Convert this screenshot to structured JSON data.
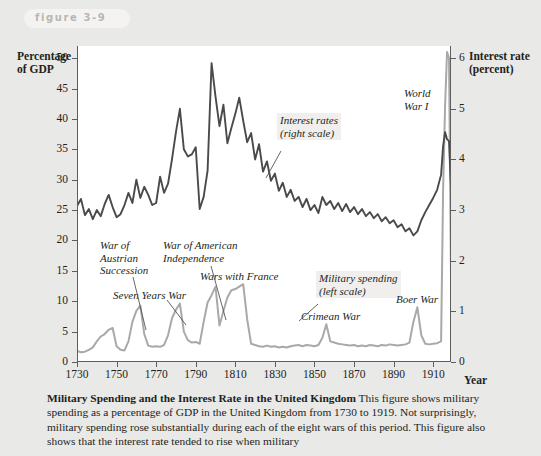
{
  "figure": {
    "badge_label": "figure 3-9"
  },
  "axes": {
    "y_left_title": "Percentage\nof GDP",
    "y_right_title": "Interest rate\n(percent)",
    "x_title": "Year"
  },
  "caption": {
    "bold_lead": "Military Spending and the Interest Rate in the United Kingdom",
    "body": " This figure shows military spending as a percentage of GDP in the United Kingdom from 1730 to 1919. Not surprisingly, military spending rose substantially during each of the eight wars of this period. This figure also shows that the interest rate tended to rise when military"
  },
  "annotations": [
    {
      "name": "war-of-austrian-succession",
      "text": "War of\nAustrian\nSuccession",
      "x": 100,
      "y": 239,
      "boxed": false
    },
    {
      "name": "seven-years-war",
      "text": "Seven Years War",
      "x": 113,
      "y": 289,
      "boxed": false
    },
    {
      "name": "war-of-american-independence",
      "text": "War of American\nIndependence",
      "x": 163,
      "y": 239,
      "boxed": false
    },
    {
      "name": "wars-with-france",
      "text": "Wars with France",
      "x": 200,
      "y": 270,
      "boxed": false
    },
    {
      "name": "interest-rates-right-scale",
      "text": "Interest rates\n(right scale)",
      "x": 277,
      "y": 113,
      "boxed": true
    },
    {
      "name": "world-war-one",
      "text": "World\nWar I",
      "x": 404,
      "y": 87,
      "boxed": false
    },
    {
      "name": "military-spending-left-scale",
      "text": "Military spending\n(left scale)",
      "x": 316,
      "y": 271,
      "boxed": true
    },
    {
      "name": "crimean-war",
      "text": "Crimean War",
      "x": 301,
      "y": 310,
      "boxed": false
    },
    {
      "name": "boer-war",
      "text": "Boer War",
      "x": 396,
      "y": 293,
      "boxed": false
    }
  ],
  "colors": {
    "interest_rate_line": "#4a4a4a",
    "military_spending_line": "#a9a9a9",
    "axis": "#5e5e5e",
    "page_background": "#e9e9e7",
    "plot_background": "#ffffff"
  },
  "chart_data": {
    "type": "line",
    "title": "Military Spending and the Interest Rate in the United Kingdom",
    "xlabel": "Year",
    "ylabel": "Percentage of GDP",
    "y2label": "Interest rate (percent)",
    "xlim": [
      1730,
      1919
    ],
    "ylim": [
      0,
      52
    ],
    "y2lim": [
      0,
      6.24
    ],
    "grid": false,
    "legend": "in-plot annotations",
    "x_ticks": [
      1730,
      1750,
      1770,
      1790,
      1810,
      1830,
      1850,
      1870,
      1890,
      1910
    ],
    "y_left_ticks": [
      0,
      5,
      10,
      15,
      20,
      25,
      30,
      35,
      40,
      45,
      50
    ],
    "y_right_ticks": [
      0,
      1,
      2,
      3,
      4,
      5,
      6
    ],
    "series": [
      {
        "name": "Interest rates (right scale)",
        "axis": "right",
        "color": "#4a4a4a",
        "x": [
          1730,
          1732,
          1734,
          1736,
          1738,
          1740,
          1742,
          1744,
          1746,
          1748,
          1750,
          1752,
          1754,
          1756,
          1758,
          1760,
          1762,
          1764,
          1766,
          1768,
          1770,
          1772,
          1774,
          1776,
          1778,
          1780,
          1782,
          1784,
          1786,
          1788,
          1790,
          1792,
          1794,
          1796,
          1798,
          1800,
          1802,
          1804,
          1806,
          1808,
          1810,
          1812,
          1814,
          1816,
          1818,
          1820,
          1822,
          1824,
          1826,
          1828,
          1830,
          1832,
          1834,
          1836,
          1838,
          1840,
          1842,
          1844,
          1846,
          1848,
          1850,
          1852,
          1854,
          1856,
          1858,
          1860,
          1862,
          1864,
          1866,
          1868,
          1870,
          1872,
          1874,
          1876,
          1878,
          1880,
          1882,
          1884,
          1886,
          1888,
          1890,
          1892,
          1894,
          1896,
          1898,
          1900,
          1902,
          1904,
          1906,
          1908,
          1910,
          1912,
          1914,
          1915,
          1916,
          1917,
          1918,
          1919
        ],
        "values_right_scale": [
          3.08,
          3.22,
          2.9,
          3.02,
          2.82,
          3.0,
          2.88,
          3.12,
          3.3,
          3.06,
          2.86,
          2.92,
          3.1,
          3.34,
          3.14,
          3.6,
          3.24,
          3.46,
          3.3,
          3.1,
          3.14,
          3.66,
          3.34,
          3.52,
          4.0,
          4.54,
          5.0,
          4.2,
          4.06,
          4.1,
          4.24,
          3.02,
          3.26,
          3.78,
          5.9,
          5.24,
          4.66,
          5.08,
          4.32,
          4.62,
          4.9,
          5.22,
          4.76,
          4.34,
          4.52,
          4.0,
          4.3,
          3.76,
          3.96,
          3.58,
          3.72,
          3.38,
          3.54,
          3.26,
          3.4,
          3.18,
          3.26,
          3.06,
          3.22,
          3.0,
          3.1,
          2.94,
          3.26,
          3.1,
          3.18,
          3.02,
          3.14,
          2.98,
          3.12,
          2.96,
          3.06,
          2.92,
          3.02,
          2.88,
          2.96,
          2.84,
          2.92,
          2.78,
          2.86,
          2.74,
          2.8,
          2.66,
          2.72,
          2.58,
          2.64,
          2.5,
          2.58,
          2.8,
          2.96,
          3.1,
          3.24,
          3.4,
          3.7,
          4.26,
          4.54,
          4.4,
          4.36,
          3.44
        ]
      },
      {
        "name": "Military spending (left scale)",
        "axis": "left",
        "color": "#a9a9a9",
        "x": [
          1730,
          1732,
          1734,
          1736,
          1738,
          1740,
          1742,
          1744,
          1746,
          1748,
          1750,
          1752,
          1754,
          1756,
          1758,
          1760,
          1762,
          1764,
          1766,
          1768,
          1770,
          1772,
          1774,
          1776,
          1778,
          1780,
          1782,
          1784,
          1786,
          1788,
          1790,
          1792,
          1794,
          1796,
          1798,
          1800,
          1802,
          1804,
          1806,
          1808,
          1810,
          1812,
          1814,
          1816,
          1818,
          1820,
          1822,
          1824,
          1826,
          1828,
          1830,
          1832,
          1834,
          1836,
          1838,
          1840,
          1842,
          1844,
          1846,
          1848,
          1850,
          1852,
          1854,
          1856,
          1858,
          1860,
          1862,
          1864,
          1866,
          1868,
          1870,
          1872,
          1874,
          1876,
          1878,
          1880,
          1882,
          1884,
          1886,
          1888,
          1890,
          1892,
          1894,
          1896,
          1898,
          1900,
          1902,
          1904,
          1906,
          1908,
          1910,
          1912,
          1914,
          1915,
          1916,
          1917,
          1918,
          1919
        ],
        "values_left_scale": [
          1.8,
          1.6,
          1.7,
          2.0,
          2.4,
          3.4,
          4.2,
          4.6,
          5.3,
          5.6,
          2.6,
          2.0,
          1.9,
          3.4,
          6.6,
          8.4,
          9.3,
          4.6,
          2.7,
          2.5,
          2.6,
          2.5,
          2.8,
          4.4,
          7.2,
          8.6,
          9.6,
          5.0,
          3.6,
          3.2,
          3.3,
          3.0,
          6.6,
          9.8,
          11.0,
          12.4,
          6.0,
          8.4,
          10.6,
          11.8,
          12.0,
          12.4,
          12.8,
          7.0,
          3.0,
          2.8,
          2.6,
          2.5,
          2.7,
          2.5,
          2.6,
          2.4,
          2.5,
          2.4,
          2.6,
          2.7,
          2.8,
          2.6,
          2.8,
          2.7,
          2.6,
          2.8,
          4.0,
          6.2,
          3.4,
          3.2,
          3.0,
          2.9,
          2.8,
          2.7,
          2.8,
          2.6,
          2.7,
          2.6,
          2.8,
          2.7,
          2.6,
          2.8,
          2.7,
          2.9,
          2.8,
          2.7,
          2.8,
          2.9,
          3.2,
          6.6,
          9.0,
          4.4,
          3.0,
          2.9,
          3.0,
          3.1,
          3.4,
          28.0,
          42.0,
          51.0,
          50.0,
          14.0
        ]
      }
    ]
  }
}
